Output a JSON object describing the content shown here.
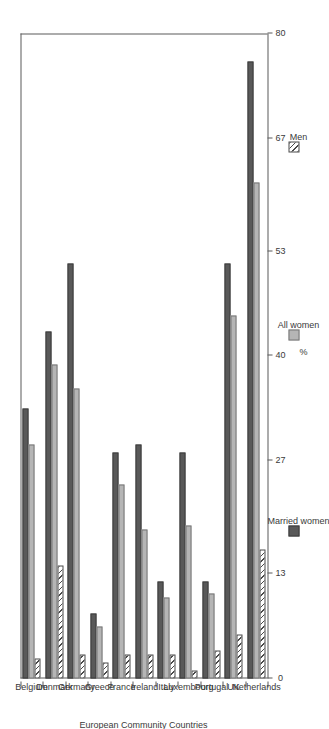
{
  "chart_data": {
    "type": "bar",
    "orientation": "horizontal",
    "title": "",
    "xlabel": "European Community Countries",
    "ylabel": "%",
    "ylim": [
      0,
      80
    ],
    "yticks": [
      0,
      13,
      27,
      40,
      53,
      67,
      80
    ],
    "ytick_labels": [
      "0",
      "13",
      "27",
      "40",
      "53",
      "67",
      "80"
    ],
    "grid": false,
    "legend_position": "right",
    "categories": [
      "Belgium",
      "Denmark",
      "Germany",
      "Greece",
      "France",
      "Ireland",
      "Italy",
      "Luxembourg",
      "Portugal",
      "UK",
      "Netherlands"
    ],
    "series": [
      {
        "name": "Married women",
        "color": "#595959",
        "values": [
          33.5,
          43.0,
          51.5,
          8.0,
          28.0,
          29.0,
          12.0,
          28.0,
          12.0,
          51.5,
          76.5
        ]
      },
      {
        "name": "All women",
        "color": "#b5b5b5",
        "values": [
          29.0,
          39.0,
          36.0,
          6.5,
          24.0,
          18.5,
          10.0,
          19.0,
          10.5,
          45.0,
          61.5
        ]
      },
      {
        "name": "Men",
        "color": "#ffffff",
        "pattern": "diagonal-hatch",
        "values": [
          2.5,
          14.0,
          3.0,
          2.0,
          3.0,
          3.0,
          3.0,
          1.0,
          3.5,
          5.5,
          16.0
        ]
      }
    ]
  },
  "legend": {
    "items": [
      {
        "label": "Married women",
        "key": "married"
      },
      {
        "label": "All women",
        "key": "allwomen"
      },
      {
        "label": "Men",
        "key": "men"
      }
    ]
  },
  "axes": {
    "value_axis_title": "%",
    "category_axis_title": "European Community Countries"
  }
}
